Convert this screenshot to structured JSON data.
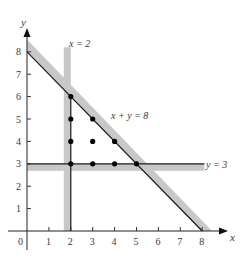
{
  "chart_data": {
    "type": "scatter",
    "title": "",
    "xlabel": "x",
    "ylabel": "y",
    "xlim": [
      0,
      8.5
    ],
    "ylim": [
      0,
      8.5
    ],
    "grid": false,
    "x_ticks": [
      "0",
      "1",
      "2",
      "3",
      "4",
      "5",
      "6",
      "7",
      "8"
    ],
    "y_ticks": [
      "1",
      "2",
      "3",
      "4",
      "5",
      "6",
      "7",
      "8"
    ],
    "lines": [
      {
        "name": "x = 2",
        "equation": "x = 2",
        "shaded_side": "left"
      },
      {
        "name": "y = 3",
        "equation": "y = 3",
        "shaded_side": "below"
      },
      {
        "name": "x + y = 8",
        "equation": "x + y = 8",
        "shaded_side": "above"
      }
    ],
    "points": [
      {
        "x": 2,
        "y": 3
      },
      {
        "x": 2,
        "y": 4
      },
      {
        "x": 2,
        "y": 5
      },
      {
        "x": 2,
        "y": 6
      },
      {
        "x": 3,
        "y": 3
      },
      {
        "x": 3,
        "y": 4
      },
      {
        "x": 3,
        "y": 5
      },
      {
        "x": 4,
        "y": 3
      },
      {
        "x": 4,
        "y": 4
      },
      {
        "x": 5,
        "y": 3
      }
    ],
    "colors": {
      "line": "#1a1a1a",
      "band": "#c8c8c8",
      "point": "#000000",
      "text": "#3a3a3a"
    }
  },
  "labels": {
    "x_axis": "x",
    "y_axis": "y",
    "line_x2": "x = 2",
    "line_y3": "y = 3",
    "line_xy8": "x + y = 8",
    "origin": "0"
  }
}
